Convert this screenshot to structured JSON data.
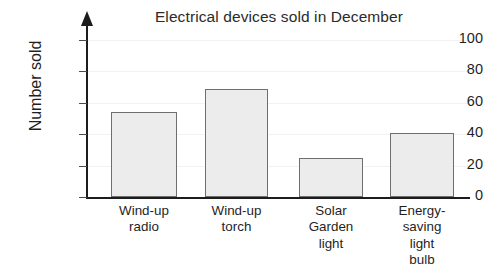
{
  "chart_data": {
    "type": "bar",
    "title": "Electrical devices sold in December",
    "xlabel": "",
    "ylabel": "Number sold",
    "categories": [
      "Wind-up radio",
      "Wind-up torch",
      "Solar Garden light",
      "Energy-saving light bulb"
    ],
    "category_lines": [
      [
        "Wind-up",
        "radio"
      ],
      [
        "Wind-up",
        "torch"
      ],
      [
        "Solar",
        "Garden",
        "light"
      ],
      [
        "Energy-",
        "saving",
        "light",
        "bulb"
      ]
    ],
    "values": [
      54,
      69,
      25,
      41
    ],
    "ylim": [
      0,
      100
    ],
    "ytick_labels": [
      "0",
      "20",
      "40",
      "60",
      "80",
      "100"
    ],
    "ytick_values": [
      0,
      20,
      40,
      60,
      80,
      100
    ],
    "grid": true,
    "legend": "none",
    "colors": {
      "bar_fill": "#ececec",
      "bar_edge": "#6e6e6e",
      "axis": "#1c1c1c",
      "grid": "#f2f2f2",
      "text": "#1f1f1f",
      "background": "#ffffff"
    }
  }
}
